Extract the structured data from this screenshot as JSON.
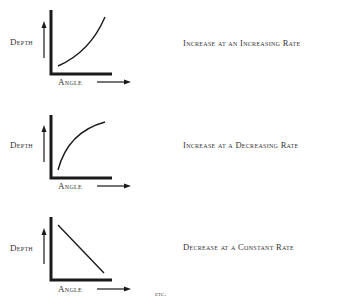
{
  "diagrams": [
    {
      "y_label": "Depth",
      "x_label": "Angle",
      "curve": "convex-increasing",
      "description": "Increase at an Increasing Rate"
    },
    {
      "y_label": "Depth",
      "x_label": "Angle",
      "curve": "concave-increasing",
      "description": "Increase at a Decreasing Rate"
    },
    {
      "y_label": "Depth",
      "x_label": "Angle",
      "curve": "linear-decreasing",
      "description": "Decrease at a Constant Rate"
    }
  ],
  "footer": {
    "etc": "etc."
  },
  "colors": {
    "ink": "#1a1a1a",
    "background": "#ffffff"
  }
}
